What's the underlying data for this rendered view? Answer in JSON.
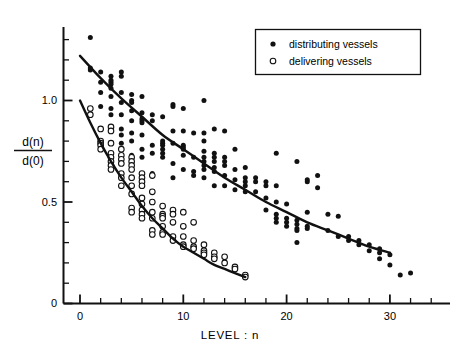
{
  "figure": {
    "background_color": "#ffffff",
    "ink_color": "#111111"
  },
  "legend": {
    "position": "top-right",
    "boxed": true,
    "entries": [
      {
        "marker": "filled-dot",
        "label": "distributing vessels"
      },
      {
        "marker": "open-circle",
        "label": "delivering  vessels"
      }
    ]
  },
  "chart_data": {
    "type": "scatter",
    "title": "",
    "subtitle": "",
    "xlabel": "LEVEL : n",
    "ylabel": "d(n)/d(0)",
    "ylabel_numerator": "d(n)",
    "ylabel_denominator": "d(0)",
    "xlim": [
      -2,
      34
    ],
    "ylim": [
      0,
      1.4
    ],
    "grid": false,
    "legend_position": "top-right",
    "xticks": [
      0,
      10,
      20,
      30
    ],
    "xtick_labels": [
      "0",
      "10",
      "20",
      "30"
    ],
    "xminor_tick_step": 2,
    "yticks": [
      0,
      0.5,
      1.0
    ],
    "ytick_labels": [
      "0",
      "0.5",
      "1.0"
    ],
    "yminor_tick_step": 0.1,
    "series": [
      {
        "name": "distributing vessels",
        "marker": "filled-dot",
        "points": [
          [
            1,
            1.31
          ],
          [
            1,
            1.16
          ],
          [
            1,
            1.15
          ],
          [
            2,
            1.14
          ],
          [
            2,
            1.09
          ],
          [
            2,
            1.04
          ],
          [
            2,
            0.97
          ],
          [
            3,
            1.12
          ],
          [
            3,
            1.1
          ],
          [
            3,
            1.09
          ],
          [
            3,
            1.08
          ],
          [
            3,
            1.06
          ],
          [
            3,
            1.02
          ],
          [
            3,
            0.96
          ],
          [
            3,
            0.93
          ],
          [
            4,
            1.14
          ],
          [
            4,
            1.12
          ],
          [
            4,
            1.04
          ],
          [
            4,
            0.99
          ],
          [
            4,
            0.93
          ],
          [
            4,
            0.86
          ],
          [
            4,
            0.83
          ],
          [
            4,
            0.79
          ],
          [
            5,
            1.03
          ],
          [
            5,
            1.0
          ],
          [
            5,
            0.99
          ],
          [
            5,
            0.95
          ],
          [
            5,
            0.9
          ],
          [
            5,
            0.84
          ],
          [
            5,
            0.8
          ],
          [
            5,
            0.73
          ],
          [
            6,
            1.02
          ],
          [
            6,
            0.94
          ],
          [
            6,
            0.91
          ],
          [
            6,
            0.9
          ],
          [
            6,
            0.89
          ],
          [
            6,
            0.83
          ],
          [
            6,
            0.76
          ],
          [
            6,
            0.72
          ],
          [
            7,
            0.93
          ],
          [
            7,
            0.9
          ],
          [
            7,
            0.78
          ],
          [
            7,
            0.74
          ],
          [
            7,
            0.64
          ],
          [
            8,
            0.92
          ],
          [
            8,
            0.8
          ],
          [
            8,
            0.79
          ],
          [
            8,
            0.78
          ],
          [
            8,
            0.76
          ],
          [
            8,
            0.74
          ],
          [
            8,
            0.72
          ],
          [
            9,
            0.98
          ],
          [
            9,
            0.97
          ],
          [
            9,
            0.85
          ],
          [
            9,
            0.79
          ],
          [
            9,
            0.69
          ],
          [
            9,
            0.62
          ],
          [
            10,
            0.96
          ],
          [
            10,
            0.85
          ],
          [
            10,
            0.78
          ],
          [
            10,
            0.77
          ],
          [
            10,
            0.76
          ],
          [
            10,
            0.73
          ],
          [
            10,
            0.66
          ],
          [
            11,
            0.84
          ],
          [
            11,
            0.72
          ],
          [
            11,
            0.65
          ],
          [
            11,
            0.63
          ],
          [
            12,
            1.0
          ],
          [
            12,
            0.84
          ],
          [
            12,
            0.8
          ],
          [
            12,
            0.75
          ],
          [
            12,
            0.72
          ],
          [
            12,
            0.7
          ],
          [
            12,
            0.68
          ],
          [
            12,
            0.66
          ],
          [
            12,
            0.62
          ],
          [
            13,
            0.86
          ],
          [
            13,
            0.74
          ],
          [
            13,
            0.72
          ],
          [
            13,
            0.7
          ],
          [
            13,
            0.67
          ],
          [
            13,
            0.65
          ],
          [
            13,
            0.58
          ],
          [
            14,
            0.85
          ],
          [
            14,
            0.72
          ],
          [
            14,
            0.7
          ],
          [
            14,
            0.68
          ],
          [
            14,
            0.63
          ],
          [
            14,
            0.58
          ],
          [
            15,
            0.76
          ],
          [
            15,
            0.66
          ],
          [
            15,
            0.61
          ],
          [
            15,
            0.56
          ],
          [
            16,
            0.67
          ],
          [
            16,
            0.62
          ],
          [
            16,
            0.6
          ],
          [
            16,
            0.58
          ],
          [
            16,
            0.55
          ],
          [
            17,
            0.62
          ],
          [
            17,
            0.6
          ],
          [
            17,
            0.55
          ],
          [
            18,
            0.6
          ],
          [
            18,
            0.58
          ],
          [
            18,
            0.52
          ],
          [
            18,
            0.46
          ],
          [
            19,
            0.74
          ],
          [
            19,
            0.58
          ],
          [
            19,
            0.5
          ],
          [
            19,
            0.44
          ],
          [
            19,
            0.42
          ],
          [
            19,
            0.4
          ],
          [
            20,
            0.49
          ],
          [
            20,
            0.42
          ],
          [
            20,
            0.4
          ],
          [
            20,
            0.38
          ],
          [
            21,
            0.7
          ],
          [
            21,
            0.41
          ],
          [
            21,
            0.39
          ],
          [
            21,
            0.37
          ],
          [
            21,
            0.36
          ],
          [
            21,
            0.3
          ],
          [
            22,
            0.61
          ],
          [
            22,
            0.6
          ],
          [
            22,
            0.45
          ],
          [
            22,
            0.38
          ],
          [
            22,
            0.37
          ],
          [
            23,
            0.63
          ],
          [
            23,
            0.57
          ],
          [
            24,
            0.44
          ],
          [
            24,
            0.36
          ],
          [
            25,
            0.43
          ],
          [
            25,
            0.33
          ],
          [
            26,
            0.33
          ],
          [
            26,
            0.31
          ],
          [
            27,
            0.31
          ],
          [
            27,
            0.29
          ],
          [
            28,
            0.29
          ],
          [
            28,
            0.26
          ],
          [
            29,
            0.27
          ],
          [
            29,
            0.25
          ],
          [
            29,
            0.22
          ],
          [
            30,
            0.24
          ],
          [
            30,
            0.19
          ],
          [
            31,
            0.14
          ],
          [
            32,
            0.15
          ]
        ],
        "fit_curve": {
          "x_start": 0,
          "x_end": 30,
          "y_start": 1.22,
          "y_end": 0.25,
          "shape": "exponential-decay",
          "points": [
            [
              0,
              1.22
            ],
            [
              2,
              1.11
            ],
            [
              4,
              1.01
            ],
            [
              6,
              0.92
            ],
            [
              8,
              0.83
            ],
            [
              10,
              0.76
            ],
            [
              12,
              0.69
            ],
            [
              14,
              0.62
            ],
            [
              16,
              0.56
            ],
            [
              18,
              0.5
            ],
            [
              20,
              0.45
            ],
            [
              22,
              0.4
            ],
            [
              24,
              0.36
            ],
            [
              26,
              0.32
            ],
            [
              28,
              0.28
            ],
            [
              30,
              0.25
            ]
          ]
        }
      },
      {
        "name": "delivering vessels",
        "marker": "open-circle",
        "points": [
          [
            1,
            0.96
          ],
          [
            1,
            0.93
          ],
          [
            2,
            0.86
          ],
          [
            2,
            0.8
          ],
          [
            2,
            0.79
          ],
          [
            2,
            0.78
          ],
          [
            2,
            0.76
          ],
          [
            3,
            0.87
          ],
          [
            3,
            0.85
          ],
          [
            3,
            0.79
          ],
          [
            3,
            0.74
          ],
          [
            3,
            0.72
          ],
          [
            3,
            0.7
          ],
          [
            3,
            0.68
          ],
          [
            3,
            0.66
          ],
          [
            4,
            0.76
          ],
          [
            4,
            0.73
          ],
          [
            4,
            0.71
          ],
          [
            4,
            0.69
          ],
          [
            4,
            0.64
          ],
          [
            4,
            0.62
          ],
          [
            4,
            0.58
          ],
          [
            5,
            0.72
          ],
          [
            5,
            0.7
          ],
          [
            5,
            0.68
          ],
          [
            5,
            0.66
          ],
          [
            5,
            0.62
          ],
          [
            5,
            0.58
          ],
          [
            5,
            0.54
          ],
          [
            5,
            0.47
          ],
          [
            5,
            0.45
          ],
          [
            6,
            0.64
          ],
          [
            6,
            0.62
          ],
          [
            6,
            0.6
          ],
          [
            6,
            0.58
          ],
          [
            6,
            0.52
          ],
          [
            6,
            0.49
          ],
          [
            6,
            0.46
          ],
          [
            6,
            0.44
          ],
          [
            6,
            0.42
          ],
          [
            7,
            0.63
          ],
          [
            7,
            0.55
          ],
          [
            7,
            0.5
          ],
          [
            7,
            0.45
          ],
          [
            7,
            0.42
          ],
          [
            7,
            0.36
          ],
          [
            7,
            0.34
          ],
          [
            8,
            0.48
          ],
          [
            8,
            0.44
          ],
          [
            8,
            0.43
          ],
          [
            8,
            0.42
          ],
          [
            8,
            0.38
          ],
          [
            8,
            0.35
          ],
          [
            8,
            0.34
          ],
          [
            9,
            0.46
          ],
          [
            9,
            0.44
          ],
          [
            9,
            0.4
          ],
          [
            9,
            0.33
          ],
          [
            9,
            0.31
          ],
          [
            10,
            0.45
          ],
          [
            10,
            0.38
          ],
          [
            10,
            0.33
          ],
          [
            10,
            0.29
          ],
          [
            10,
            0.28
          ],
          [
            11,
            0.4
          ],
          [
            11,
            0.31
          ],
          [
            11,
            0.28
          ],
          [
            11,
            0.27
          ],
          [
            12,
            0.29
          ],
          [
            12,
            0.26
          ],
          [
            12,
            0.25
          ],
          [
            12,
            0.24
          ],
          [
            13,
            0.25
          ],
          [
            13,
            0.23
          ],
          [
            13,
            0.22
          ],
          [
            14,
            0.23
          ],
          [
            14,
            0.2
          ],
          [
            15,
            0.18
          ],
          [
            15,
            0.17
          ],
          [
            16,
            0.14
          ],
          [
            16,
            0.13
          ]
        ],
        "fit_curve": {
          "x_start": 0,
          "x_end": 16,
          "y_start": 1.0,
          "y_end": 0.13,
          "shape": "exponential-decay",
          "points": [
            [
              0,
              1.0
            ],
            [
              1,
              0.89
            ],
            [
              2,
              0.79
            ],
            [
              3,
              0.7
            ],
            [
              4,
              0.62
            ],
            [
              5,
              0.55
            ],
            [
              6,
              0.48
            ],
            [
              7,
              0.42
            ],
            [
              8,
              0.37
            ],
            [
              9,
              0.32
            ],
            [
              10,
              0.28
            ],
            [
              11,
              0.25
            ],
            [
              12,
              0.22
            ],
            [
              13,
              0.19
            ],
            [
              14,
              0.17
            ],
            [
              15,
              0.15
            ],
            [
              16,
              0.13
            ]
          ]
        }
      }
    ]
  }
}
